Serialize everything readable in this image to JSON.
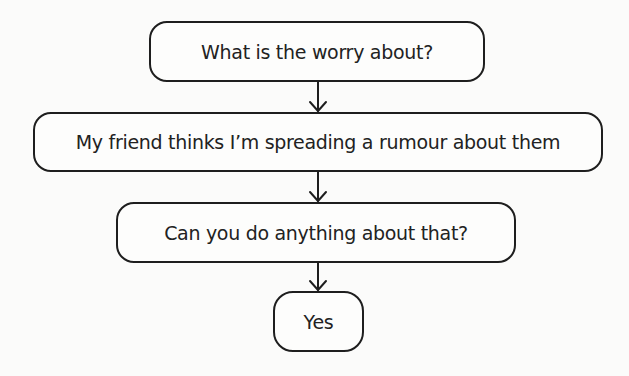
{
  "diagram": {
    "type": "flowchart",
    "direction": "top-to-bottom",
    "nodes": [
      {
        "id": "n1",
        "label": "What is the worry about?"
      },
      {
        "id": "n2",
        "label": "My friend thinks I’m spreading a rumour about them"
      },
      {
        "id": "n3",
        "label": "Can you do anything about that?"
      },
      {
        "id": "n4",
        "label": "Yes"
      }
    ],
    "edges": [
      {
        "from": "n1",
        "to": "n2"
      },
      {
        "from": "n2",
        "to": "n3"
      },
      {
        "from": "n3",
        "to": "n4"
      }
    ],
    "colors": {
      "background": "#fbfbfa",
      "stroke": "#1e1e1e",
      "text": "#222222"
    }
  }
}
